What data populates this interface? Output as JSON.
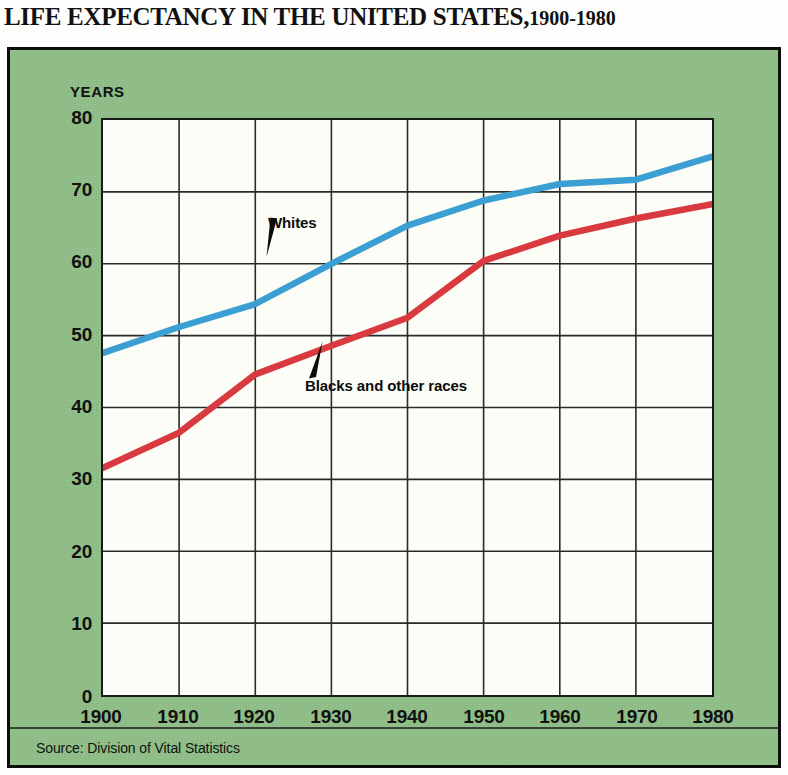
{
  "title": {
    "main": "LIFE EXPECTANCY IN THE UNITED STATES,",
    "range": "1900-1980"
  },
  "axis": {
    "y_caption": "YEARS",
    "y_ticks": [
      "80",
      "70",
      "60",
      "50",
      "40",
      "30",
      "20",
      "10",
      "0"
    ],
    "x_ticks": [
      "1900",
      "1910",
      "1920",
      "1930",
      "1940",
      "1950",
      "1960",
      "1970",
      "1980"
    ]
  },
  "annotations": {
    "whites_label": "Whites",
    "blacks_label": "Blacks and other races"
  },
  "source": "Source: Division of Vital Statistics",
  "colors": {
    "panel_green": "#8ebf86",
    "whites_blue": "#3b9fd4",
    "blacks_red": "#d93a3f",
    "plot_background": "#fdfdf7",
    "ink": "#111111"
  },
  "chart_data": {
    "type": "line",
    "xlabel": "",
    "ylabel": "YEARS",
    "x": [
      1900,
      1910,
      1920,
      1930,
      1940,
      1950,
      1960,
      1970,
      1980
    ],
    "xlim": [
      1900,
      1980
    ],
    "ylim": [
      0,
      80
    ],
    "ytick_step": 10,
    "grid": true,
    "legend": "inline-annotations",
    "series": [
      {
        "name": "Whites",
        "color": "#3b9fd4",
        "values": [
          47.6,
          51.2,
          54.4,
          60.0,
          65.3,
          68.8,
          71.1,
          71.7,
          74.9
        ]
      },
      {
        "name": "Blacks and other races",
        "color": "#d93a3f",
        "values": [
          31.6,
          36.5,
          44.6,
          48.6,
          52.5,
          60.4,
          63.9,
          66.3,
          68.3
        ]
      }
    ],
    "source": "Source: Division of Vital Statistics"
  }
}
